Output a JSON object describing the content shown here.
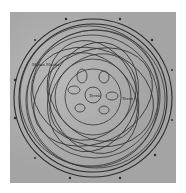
{
  "diagram": {
    "type": "planetary-orbit-loops",
    "center_label": "Terra",
    "left_label": "Motus Martis",
    "right_label": "Terra",
    "rim_labels": [
      "♈",
      "♉",
      "♊",
      "♋",
      "♌",
      "♍",
      "♎",
      "♏",
      "♐",
      "♑",
      "♒",
      "♓"
    ],
    "colors": {
      "background": "#ffffff",
      "plate": "#a9a9a9",
      "ink": "#2a2a2a"
    }
  }
}
